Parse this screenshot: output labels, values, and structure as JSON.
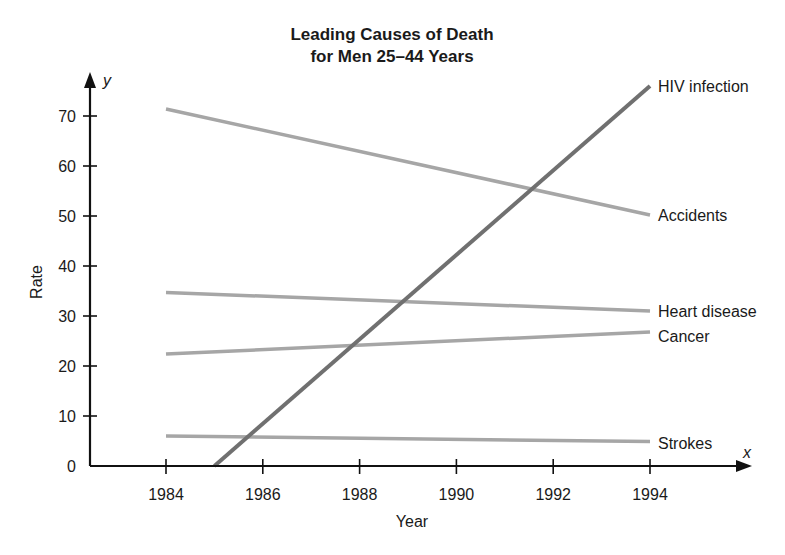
{
  "chart_data": {
    "type": "line",
    "title": "Leading Causes of Death",
    "subtitle": "for Men 25–44 Years",
    "xlabel": "Year",
    "ylabel": "Rate",
    "x_axis_var": "x",
    "y_axis_var": "y",
    "xlim": [
      1982.5,
      1996.1
    ],
    "ylim": [
      0,
      78
    ],
    "x_ticks": [
      1984,
      1986,
      1988,
      1990,
      1992,
      1994
    ],
    "y_ticks": [
      0,
      10,
      20,
      30,
      40,
      50,
      60,
      70
    ],
    "grid": false,
    "legend": "inline labels at right end of each line",
    "series": [
      {
        "name": "HIV infection",
        "x": [
          1985,
          1994
        ],
        "values": [
          0,
          76
        ],
        "color": "#707070",
        "width": 4
      },
      {
        "name": "Accidents",
        "x": [
          1984,
          1994
        ],
        "values": [
          71.4,
          50.2
        ],
        "color": "#a6a6a6",
        "width": 3.5
      },
      {
        "name": "Heart disease",
        "x": [
          1984,
          1994
        ],
        "values": [
          34.7,
          31.0
        ],
        "color": "#a6a6a6",
        "width": 3.5
      },
      {
        "name": "Cancer",
        "x": [
          1984,
          1994
        ],
        "values": [
          22.4,
          26.8
        ],
        "color": "#a6a6a6",
        "width": 3.5
      },
      {
        "name": "Strokes",
        "x": [
          1984,
          1994
        ],
        "values": [
          6.0,
          4.9
        ],
        "color": "#a6a6a6",
        "width": 3.5
      }
    ]
  }
}
